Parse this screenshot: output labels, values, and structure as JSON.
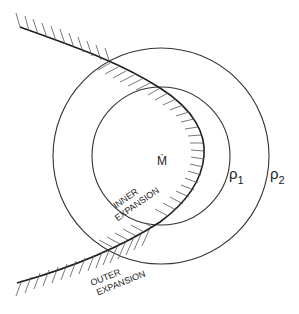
{
  "diagram": {
    "center_label": "Ṁ",
    "inner_circle_label": "ρ",
    "inner_circle_subscript": "1",
    "outer_circle_label": "ρ",
    "outer_circle_subscript": "2",
    "inner_expansion_line1": "INNER",
    "inner_expansion_line2": "EXPANSION",
    "outer_expansion_line1": "OUTER",
    "outer_expansion_line2": "EXPANSION",
    "stroke_color": "#2a2a2a",
    "hatch_color": "#555555"
  }
}
